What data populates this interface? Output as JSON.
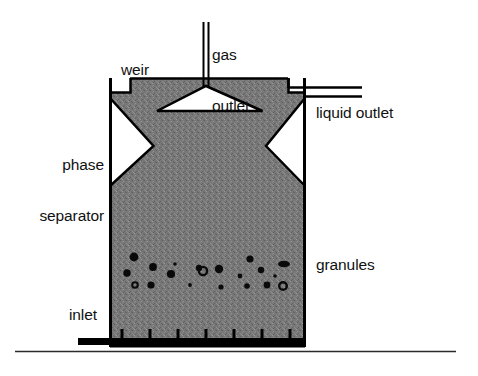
{
  "diagram": {
    "background_color": "#ffffff",
    "line_color": "#000000",
    "sludge_fill_color": "#787878",
    "labels": {
      "gas_outlet": "gas\noutlet",
      "gas_outlet_line1": "gas",
      "gas_outlet_line2": "outlet",
      "weir": "weir",
      "liquid_outlet": "liquid outlet",
      "phase_separator": "phase\nseparator",
      "phase_separator_line1": "phase",
      "phase_separator_line2": "separator",
      "granules": "granules",
      "inlet": "inlet"
    },
    "parts": {
      "reactor_vessel": "reactor-vessel",
      "sludge_bed": "sludge-bed",
      "gas_hood": "gas-collection-hood",
      "gas_pipe": "gas-outlet-pipe",
      "weir_notch": "weir-notch",
      "liquid_outlet_channel": "liquid-outlet-channel",
      "left_separator_gap": "left-phase-separator-gap",
      "right_separator_gap": "right-phase-separator-gap",
      "inlet_manifold": "inlet-distribution-manifold",
      "ground_line": "ground-line"
    },
    "geometry": {
      "vessel_left_x": 110,
      "vessel_right_x": 305,
      "vessel_top_y": 78,
      "vessel_bottom_y": 346,
      "gas_pipe_x": 206,
      "gas_pipe_top_y": 22,
      "hood_apex_y": 86,
      "hood_base_y": 111,
      "hood_base_left_x": 157,
      "hood_base_right_x": 262,
      "separator_gap_top_y": 98,
      "separator_gap_bottom_y": 186,
      "separator_apex_y": 146,
      "left_gap_apex_x": 153,
      "right_gap_apex_x": 266,
      "manifold_y": 341,
      "manifold_left_x": 78,
      "manifold_right_x": 305,
      "ground_y": 352,
      "ground_left_x": 15,
      "ground_right_x": 456
    },
    "inlet_nozzles_x": [
      122,
      150,
      178,
      206,
      234,
      262,
      290
    ],
    "granules": [
      {
        "cx": 134,
        "cy": 257,
        "r": 4.4,
        "type": "filled"
      },
      {
        "cx": 127,
        "cy": 273,
        "r": 3.7,
        "type": "filled"
      },
      {
        "cx": 135,
        "cy": 285,
        "r": 2.8,
        "type": "ring"
      },
      {
        "cx": 153,
        "cy": 267,
        "r": 3.9,
        "type": "filled"
      },
      {
        "cx": 151,
        "cy": 285,
        "r": 3.6,
        "type": "filled"
      },
      {
        "cx": 171,
        "cy": 274,
        "r": 4.1,
        "type": "filled"
      },
      {
        "cx": 175,
        "cy": 264,
        "r": 1.8,
        "type": "filled"
      },
      {
        "cx": 190,
        "cy": 285,
        "r": 1.9,
        "type": "filled"
      },
      {
        "cx": 199,
        "cy": 268,
        "r": 3.2,
        "type": "filled"
      },
      {
        "cx": 203,
        "cy": 271,
        "r": 4.1,
        "type": "ring"
      },
      {
        "cx": 219,
        "cy": 269,
        "r": 4.2,
        "type": "filled"
      },
      {
        "cx": 221,
        "cy": 287,
        "r": 2.6,
        "type": "filled"
      },
      {
        "cx": 240,
        "cy": 276,
        "r": 2.4,
        "type": "filled"
      },
      {
        "cx": 247,
        "cy": 286,
        "r": 2.8,
        "type": "filled"
      },
      {
        "cx": 250,
        "cy": 259,
        "r": 3.6,
        "type": "filled"
      },
      {
        "cx": 261,
        "cy": 270,
        "r": 3.2,
        "type": "filled"
      },
      {
        "cx": 267,
        "cy": 285,
        "r": 3.4,
        "type": "filled"
      },
      {
        "cx": 275,
        "cy": 276,
        "r": 1.8,
        "type": "filled"
      },
      {
        "cx": 284,
        "cy": 264,
        "r": 4.4,
        "type": "ellipse"
      },
      {
        "cx": 283,
        "cy": 286,
        "r": 3.8,
        "type": "ring"
      }
    ]
  }
}
